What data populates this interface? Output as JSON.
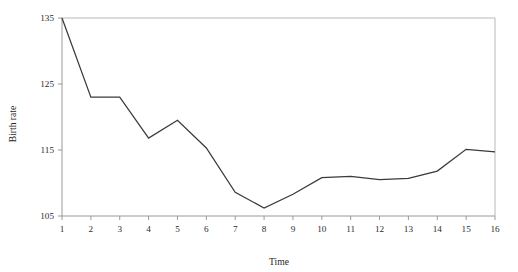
{
  "chart_data": {
    "type": "line",
    "title": "",
    "xlabel": "Time",
    "ylabel": "Birth rate",
    "x": [
      1,
      2,
      3,
      4,
      5,
      6,
      7,
      8,
      9,
      10,
      11,
      12,
      13,
      14,
      15,
      16
    ],
    "values": [
      135.0,
      123.0,
      123.0,
      116.8,
      119.5,
      115.3,
      108.6,
      106.2,
      108.3,
      110.8,
      111.0,
      110.5,
      110.7,
      111.8,
      115.1,
      114.7
    ],
    "series": [
      {
        "name": "Birth rate",
        "values": [
          135.0,
          123.0,
          123.0,
          116.8,
          119.5,
          115.3,
          108.6,
          106.2,
          108.3,
          110.8,
          111.0,
          110.5,
          110.7,
          111.8,
          115.1,
          114.7
        ]
      }
    ],
    "xlim": [
      1,
      16
    ],
    "ylim": [
      105,
      135
    ],
    "xticks": [
      1,
      2,
      3,
      4,
      5,
      6,
      7,
      8,
      9,
      10,
      11,
      12,
      13,
      14,
      15,
      16
    ],
    "xtick_labels": [
      "1",
      "2",
      "3",
      "4",
      "5",
      "6",
      "7",
      "8",
      "9",
      "10",
      "11",
      "12",
      "13",
      "14",
      "15",
      "16"
    ],
    "yticks": [
      105,
      115,
      125,
      135
    ],
    "ytick_labels": [
      "105",
      "115",
      "125",
      "135"
    ],
    "grid": false,
    "legend": null,
    "legend_position": "none",
    "line_color": "#3a3a3a",
    "axis_color": "#9a9a9a",
    "frame_color": "#b9b9b9",
    "background_color": "#ffffff"
  }
}
